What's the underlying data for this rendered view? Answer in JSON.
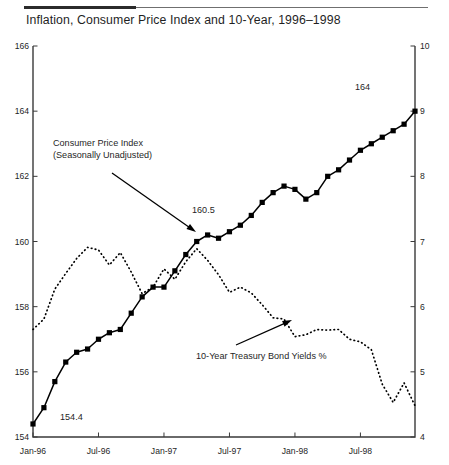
{
  "header": {
    "title": "Inflation, Consumer Price Index and 10-Year, 1996–1998"
  },
  "annotations": {
    "cpi_line1": "Consumer Price Index",
    "cpi_line2": "(Seasonally Unadjusted)",
    "bond": "10-Year Treasury Bond Yields %",
    "point_start": "154.4",
    "point_mid": "160.5",
    "point_end": "164"
  },
  "colors": {
    "ink": "#1a1a1a",
    "axis": "#3a3a3a",
    "series_cpi": "#000000",
    "series_bond": "#000000",
    "background": "#ffffff"
  },
  "chart_data": {
    "type": "line",
    "title": "Inflation, Consumer Price Index and 10-Year, 1996–1998",
    "xlabel": "",
    "ylabel": "Consumer Price Index",
    "y2label": "10-Year Treasury Bond Yields %",
    "grid": false,
    "legend": "annotations",
    "xlim": [
      0,
      35
    ],
    "ylim": [
      154,
      166
    ],
    "y2lim": [
      4,
      10
    ],
    "yticks": [
      154,
      156,
      158,
      160,
      162,
      164,
      166
    ],
    "y2ticks": [
      4,
      5,
      6,
      7,
      8,
      9,
      10
    ],
    "xticks": [
      0,
      6,
      12,
      18,
      24,
      30
    ],
    "xticklabels": [
      "Jan-96",
      "Jul-96",
      "Jan-97",
      "Jul-97",
      "Jan-98",
      "Jul-98"
    ],
    "x": [
      0,
      1,
      2,
      3,
      4,
      5,
      6,
      7,
      8,
      9,
      10,
      11,
      12,
      13,
      14,
      15,
      16,
      17,
      18,
      19,
      20,
      21,
      22,
      23,
      24,
      25,
      26,
      27,
      28,
      29,
      30,
      31,
      32,
      33,
      34,
      35
    ],
    "series": [
      {
        "name": "Consumer Price Index (Seasonally Unadjusted)",
        "axis": "left",
        "style": "solid-with-square-markers",
        "marker": "square",
        "values": [
          154.4,
          154.9,
          155.7,
          156.3,
          156.6,
          156.7,
          157.0,
          157.2,
          157.3,
          157.8,
          158.3,
          158.6,
          158.6,
          159.1,
          159.6,
          160.0,
          160.2,
          160.1,
          160.3,
          160.5,
          160.8,
          161.2,
          161.5,
          161.7,
          161.6,
          161.3,
          161.5,
          162.0,
          162.2,
          162.5,
          162.8,
          163.0,
          163.2,
          163.4,
          163.6,
          164.0
        ]
      },
      {
        "name": "10-Year Treasury Bond Yields %",
        "axis": "right",
        "style": "dotted",
        "marker": "none",
        "values": [
          5.65,
          5.81,
          6.27,
          6.51,
          6.74,
          6.91,
          6.87,
          6.64,
          6.83,
          6.53,
          6.2,
          6.3,
          6.58,
          6.42,
          6.69,
          6.89,
          6.71,
          6.49,
          6.22,
          6.3,
          6.21,
          6.03,
          5.83,
          5.81,
          5.54,
          5.57,
          5.65,
          5.64,
          5.65,
          5.5,
          5.46,
          5.34,
          4.81,
          4.53,
          4.83,
          4.48
        ]
      }
    ],
    "point_annotations": [
      {
        "label": "154.4",
        "x": 0,
        "y": 154.4,
        "axis": "left"
      },
      {
        "label": "160.5",
        "x": 14,
        "y": 160.5,
        "axis": "left"
      },
      {
        "label": "164",
        "x": 35,
        "y": 164.0,
        "axis": "left"
      }
    ]
  }
}
